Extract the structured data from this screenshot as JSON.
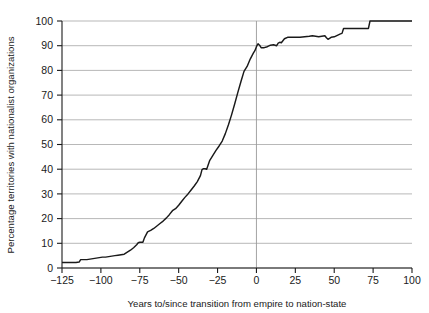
{
  "chart_data": {
    "type": "line",
    "title": "",
    "xlabel": "Years to/since transition from empire to nation-state",
    "ylabel": "Percentage territories with nationalist organizations",
    "xlim": [
      -125,
      100
    ],
    "ylim": [
      0,
      100
    ],
    "xticks": [
      -125,
      -100,
      -75,
      -50,
      -25,
      0,
      25,
      50,
      75,
      100
    ],
    "xtick_labels": [
      "−125",
      "−100",
      "−75",
      "−50",
      "−25",
      "0",
      "25",
      "50",
      "75",
      "100"
    ],
    "yticks": [
      0,
      10,
      20,
      30,
      40,
      50,
      60,
      70,
      80,
      90,
      100
    ],
    "ytick_labels": [
      "0",
      "10",
      "20",
      "30",
      "40",
      "50",
      "60",
      "70",
      "80",
      "90",
      "100"
    ],
    "grid": "horizontal",
    "legend": "none",
    "line_color": "#1a1a1a",
    "grid_color": "#9a9a9a",
    "reference_line": {
      "axis": "x",
      "value": 0,
      "color": "#9a9a9a"
    },
    "series": [
      {
        "name": "Percentage territories with nationalist organizations",
        "x": [
          -125,
          -122,
          -119,
          -116,
          -114,
          -113,
          -111,
          -109,
          -107,
          -105,
          -103,
          -101,
          -99,
          -97,
          -95,
          -93,
          -91,
          -89,
          -87,
          -85,
          -83,
          -81,
          -79,
          -77,
          -76,
          -75,
          -74,
          -73,
          -72,
          -70,
          -68,
          -66,
          -64,
          -62,
          -60,
          -58,
          -56,
          -54,
          -52,
          -50,
          -48,
          -46,
          -44,
          -42,
          -40,
          -38,
          -36,
          -35,
          -34,
          -33,
          -32,
          -31,
          -30,
          -28,
          -26,
          -24,
          -22,
          -20,
          -18,
          -16,
          -14,
          -12,
          -10,
          -8,
          -6,
          -4,
          -3,
          -2,
          -1,
          0,
          1,
          2,
          3,
          5,
          7,
          9,
          11,
          13,
          14,
          15,
          16,
          18,
          20,
          22,
          25,
          28,
          31,
          34,
          36,
          38,
          40,
          42,
          44,
          45,
          46,
          47,
          48,
          50,
          52,
          54,
          55,
          56,
          58,
          60,
          64,
          68,
          71,
          72,
          73,
          75,
          80,
          85,
          90,
          95,
          100
        ],
        "y": [
          2.2,
          2.2,
          2.2,
          2.2,
          2.4,
          3.4,
          3.4,
          3.4,
          3.6,
          3.8,
          4.0,
          4.2,
          4.4,
          4.4,
          4.6,
          4.8,
          5.0,
          5.2,
          5.4,
          5.6,
          6.4,
          7.2,
          8.2,
          9.4,
          10.2,
          10.4,
          10.4,
          10.4,
          12.2,
          14.6,
          15.2,
          16.0,
          17.0,
          18.0,
          19.0,
          20.2,
          21.6,
          23.2,
          24.0,
          25.4,
          27.0,
          28.6,
          30.0,
          31.6,
          33.2,
          35.0,
          37.4,
          39.8,
          40.2,
          40.2,
          40.0,
          41.8,
          43.6,
          45.6,
          47.6,
          49.4,
          51.4,
          54.4,
          58.0,
          62.0,
          66.4,
          71.0,
          75.4,
          79.6,
          81.6,
          84.6,
          85.8,
          87.0,
          88.0,
          89.6,
          90.8,
          90.2,
          89.2,
          89.2,
          89.6,
          90.2,
          90.4,
          90.0,
          91.0,
          91.4,
          91.2,
          92.8,
          93.4,
          93.4,
          93.4,
          93.4,
          93.6,
          93.8,
          94.0,
          93.8,
          93.6,
          93.8,
          94.0,
          93.2,
          92.6,
          93.0,
          93.4,
          93.6,
          94.2,
          94.8,
          95.0,
          97.0,
          97.0,
          97.0,
          97.0,
          97.0,
          97.0,
          97.0,
          100.0,
          100.0,
          100.0,
          100.0,
          100.0,
          100.0,
          100.0
        ]
      }
    ]
  }
}
